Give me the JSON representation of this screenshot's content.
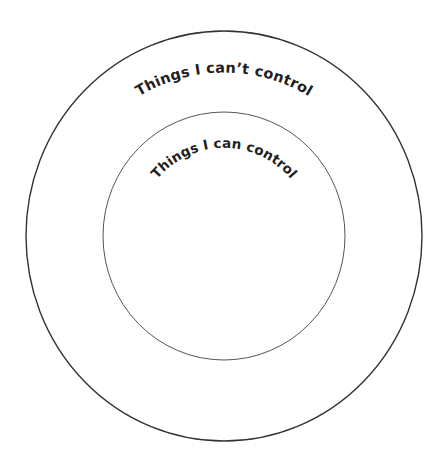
{
  "diagram": {
    "type": "circle-of-control",
    "outer_circle": {
      "label": "Things I can’t control",
      "stroke_color": "#333333"
    },
    "inner_circle": {
      "label": "Things I can control",
      "stroke_color": "#555555"
    },
    "text_color": "#1f1f1f",
    "background_color": "#ffffff"
  }
}
